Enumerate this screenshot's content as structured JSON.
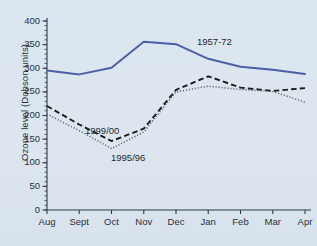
{
  "chart_data": {
    "type": "line",
    "title": "",
    "xlabel": "",
    "ylabel": "Ozone level (Dobson units)",
    "categories": [
      "Aug",
      "Sept",
      "Oct",
      "Nov",
      "Dec",
      "Jan",
      "Feb",
      "Mar",
      "Apr"
    ],
    "ylim": [
      0,
      400
    ],
    "ytick_labels": [
      "0",
      "50",
      "100",
      "150",
      "200",
      "250",
      "300",
      "350",
      "400"
    ],
    "ytick_values": [
      0,
      50,
      100,
      150,
      200,
      250,
      300,
      350,
      400
    ],
    "yminor_step": 10,
    "grid": false,
    "legend": "inline-annotations",
    "series": [
      {
        "name": "1957-72",
        "style": "solid",
        "color": "#4a5fa5",
        "values": [
          295,
          287,
          301,
          356,
          351,
          320,
          303,
          297,
          288
        ],
        "label_x_category": "Jan",
        "label_text": "1957-72"
      },
      {
        "name": "1999/00",
        "style": "dashed",
        "color": "#1b1b1b",
        "values": [
          220,
          181,
          146,
          172,
          254,
          283,
          259,
          252,
          258
        ],
        "label_text": "1999/00"
      },
      {
        "name": "1995/96",
        "style": "dotted",
        "color": "#55606e",
        "values": [
          203,
          168,
          130,
          165,
          250,
          262,
          255,
          251,
          228
        ],
        "label_text": "1995/96"
      }
    ]
  },
  "axis": {
    "y_title": "Ozone level (Dobson units)"
  }
}
